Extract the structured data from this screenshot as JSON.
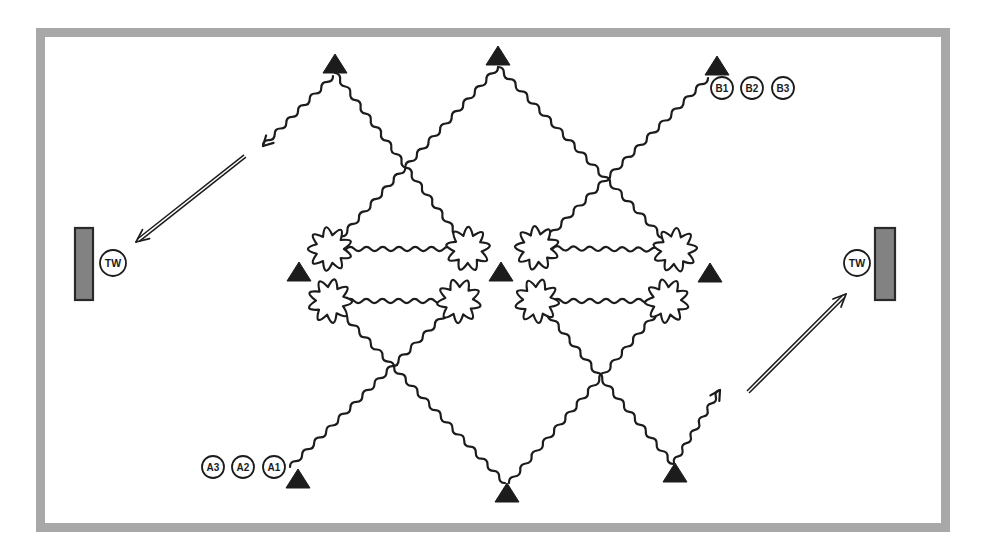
{
  "figure": {
    "background": "#ffffff",
    "frame_color": "#a8a8a8",
    "ink_color": "#1c1c1c",
    "wall_fill": "#828282",
    "wall_stroke": "#2a2a2a"
  },
  "diagram": {
    "frame": {
      "x": 40.5,
      "y": 32.5,
      "w": 905,
      "h": 495,
      "thickness": 9
    },
    "triangles": [
      {
        "x": 335,
        "y": 73
      },
      {
        "x": 498,
        "y": 65
      },
      {
        "x": 717,
        "y": 75
      },
      {
        "x": 299,
        "y": 281
      },
      {
        "x": 501,
        "y": 281
      },
      {
        "x": 710,
        "y": 282
      },
      {
        "x": 298,
        "y": 488
      },
      {
        "x": 507,
        "y": 502
      },
      {
        "x": 675,
        "y": 482
      }
    ],
    "gears": [
      {
        "x": 330,
        "y": 249
      },
      {
        "x": 468,
        "y": 249
      },
      {
        "x": 330,
        "y": 301
      },
      {
        "x": 459,
        "y": 301
      },
      {
        "x": 537,
        "y": 248
      },
      {
        "x": 675,
        "y": 250
      },
      {
        "x": 537,
        "y": 301
      },
      {
        "x": 667,
        "y": 301
      }
    ],
    "chains": [
      {
        "x1": 335,
        "y1": 73,
        "x2": 468,
        "y2": 249
      },
      {
        "x1": 498,
        "y1": 67,
        "x2": 330,
        "y2": 249
      },
      {
        "x1": 498,
        "y1": 67,
        "x2": 675,
        "y2": 250
      },
      {
        "x1": 708,
        "y1": 78,
        "x2": 537,
        "y2": 248
      },
      {
        "x1": 290,
        "y1": 467,
        "x2": 459,
        "y2": 301
      },
      {
        "x1": 505,
        "y1": 483,
        "x2": 330,
        "y2": 301
      },
      {
        "x1": 509,
        "y1": 483,
        "x2": 667,
        "y2": 301
      },
      {
        "x1": 673,
        "y1": 464,
        "x2": 537,
        "y2": 301
      }
    ],
    "connectors": [
      {
        "x1": 330,
        "y1": 249,
        "x2": 468,
        "y2": 249
      },
      {
        "x1": 330,
        "y1": 301,
        "x2": 459,
        "y2": 301
      },
      {
        "x1": 537,
        "y1": 248,
        "x2": 675,
        "y2": 250
      },
      {
        "x1": 537,
        "y1": 301,
        "x2": 667,
        "y2": 301
      }
    ],
    "arrow_chains": [
      {
        "x1": 333,
        "y1": 76,
        "x2": 263,
        "y2": 146
      },
      {
        "x1": 674,
        "y1": 463,
        "x2": 720,
        "y2": 390
      }
    ],
    "double_arrows": [
      {
        "x1": 245,
        "y1": 156,
        "x2": 136,
        "y2": 242
      },
      {
        "x1": 748,
        "y1": 392,
        "x2": 846,
        "y2": 294
      }
    ],
    "walls": [
      {
        "id": "tw-wall-left",
        "x": 75,
        "y": 228,
        "w": 18,
        "h": 72,
        "cx": 113,
        "cy": 263,
        "label": "TW"
      },
      {
        "id": "tw-wall-right",
        "x": 875,
        "y": 228,
        "w": 20,
        "h": 72,
        "cx": 857,
        "cy": 263,
        "label": "TW"
      }
    ],
    "sites": [
      {
        "id": "site-B1",
        "x": 722,
        "y": 88,
        "label": "B1"
      },
      {
        "id": "site-B2",
        "x": 752,
        "y": 88,
        "label": "B2"
      },
      {
        "id": "site-B3",
        "x": 783,
        "y": 88,
        "label": "B3"
      },
      {
        "id": "site-A3",
        "x": 213,
        "y": 467,
        "label": "A3"
      },
      {
        "id": "site-A2",
        "x": 243,
        "y": 467,
        "label": "A2"
      },
      {
        "id": "site-A1",
        "x": 274,
        "y": 467,
        "label": "A1"
      }
    ]
  }
}
